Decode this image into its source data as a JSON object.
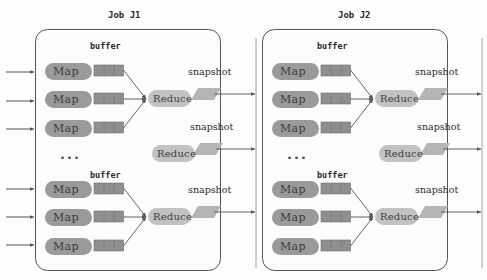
{
  "diagram": {
    "title_left": "Job  J1",
    "title_right": "Job  J2",
    "labels": {
      "map": "Map",
      "reduce": "Reduce",
      "buffer": "buffer",
      "snapshot": "snapshot",
      "ellipsis": "..."
    },
    "colors": {
      "map_fill": "#9a9a9a",
      "reduce_fill": "#c2c2c2",
      "buffer_fill": "#8f8f8f",
      "snapshot_fill": "#b5b5b5",
      "panel_border": "#555555",
      "panel_fill": "#fcfcfc",
      "arrow": "#555555",
      "text": "#2b2b2b",
      "background": "#fdfdfd"
    },
    "panels": [
      {
        "id": "job-j1",
        "title": "Job  J1",
        "groups": [
          {
            "id": "group-1",
            "buffer_label": "buffer",
            "maps": [
              {
                "label": "Map",
                "buffer_cells": 3
              },
              {
                "label": "Map",
                "buffer_cells": 3
              },
              {
                "label": "Map",
                "buffer_cells": 3
              }
            ],
            "reduce": {
              "label": "Reduce"
            },
            "snapshot": {
              "label": "snapshot"
            }
          },
          {
            "id": "group-middle",
            "buffer_label": "",
            "maps": [],
            "reduce": {
              "label": "Reduce"
            },
            "snapshot": {
              "label": "snapshot"
            }
          },
          {
            "id": "group-2",
            "buffer_label": "buffer",
            "maps": [
              {
                "label": "Map",
                "buffer_cells": 3
              },
              {
                "label": "Map",
                "buffer_cells": 3
              },
              {
                "label": "Map",
                "buffer_cells": 3
              }
            ],
            "reduce": {
              "label": "Reduce"
            },
            "snapshot": {
              "label": "snapshot"
            }
          }
        ]
      },
      {
        "id": "job-j2",
        "title": "Job  J2",
        "groups": [
          {
            "id": "group-1",
            "buffer_label": "buffer",
            "maps": [
              {
                "label": "Map",
                "buffer_cells": 3
              },
              {
                "label": "Map",
                "buffer_cells": 3
              },
              {
                "label": "Map",
                "buffer_cells": 3
              }
            ],
            "reduce": {
              "label": "Reduce"
            },
            "snapshot": {
              "label": "snapshot"
            }
          },
          {
            "id": "group-middle",
            "buffer_label": "",
            "maps": [],
            "reduce": {
              "label": "Reduce"
            },
            "snapshot": {
              "label": "snapshot"
            }
          },
          {
            "id": "group-2",
            "buffer_label": "buffer",
            "maps": [
              {
                "label": "Map",
                "buffer_cells": 3
              },
              {
                "label": "Map",
                "buffer_cells": 3
              },
              {
                "label": "Map",
                "buffer_cells": 3
              }
            ],
            "reduce": {
              "label": "Reduce"
            },
            "snapshot": {
              "label": "snapshot"
            }
          }
        ]
      }
    ],
    "input_arrow_count": 6,
    "inter_panel_arrow_count": 3,
    "output_arrow_count": 3
  }
}
